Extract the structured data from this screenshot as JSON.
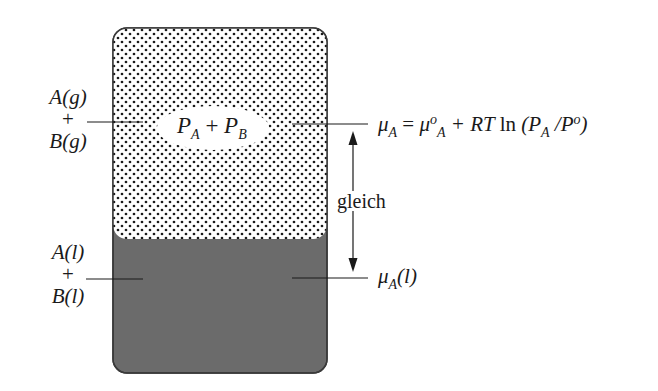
{
  "diagram": {
    "type": "vapor-liquid equilibrium schematic",
    "colors": {
      "gas_dots": "#1a1a1a",
      "gas_background": "#ffffff",
      "liquid_fill": "#6b6b6b",
      "outline": "#3a3a3a",
      "lines": "#1a1a1a"
    },
    "gas_phase": {
      "label_top": "A(g)",
      "label_plus": "+",
      "label_bottom": "B(g)",
      "pressure_P": "P",
      "pressure_sub_A": "A",
      "pressure_plus": "+",
      "pressure_sub_B": "B"
    },
    "liquid_phase": {
      "label_top": "A(l)",
      "label_plus": "+",
      "label_bottom": "B(l)"
    },
    "equation": {
      "mu": "μ",
      "sub_A": "A",
      "equals": " = ",
      "mu0": "μ",
      "sup_o": "o",
      "sub_A2": "A",
      "plus_RT": " + RT ",
      "ln": "ln",
      "open": " (P",
      "sub_A3": "A",
      "slash": " /P",
      "sup_o2": "o",
      "close": ")"
    },
    "equality_label": "gleich",
    "liquid_potential": {
      "mu": "μ",
      "sub_A": "A",
      "phase": "(l)"
    }
  }
}
